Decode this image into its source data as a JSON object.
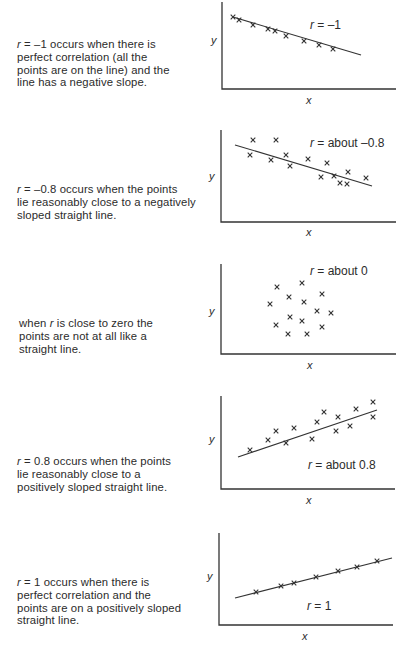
{
  "figure": {
    "panels": [
      {
        "id": "r-minus-1",
        "description_lines": [
          "r = –1 occurs when there is",
          "perfect correlation (all the",
          "points are on the line) and the",
          "line has a negative slope."
        ],
        "label_prefix": "r",
        "label_value": " = –1",
        "x_axis_label": "x",
        "y_axis_label": "y"
      },
      {
        "id": "r-minus-0.8",
        "description_lines": [
          "r = –0.8 occurs when the points",
          "lie reasonably close to a negatively",
          "sloped straight line."
        ],
        "label_prefix": "r",
        "label_value": " = about –0.8",
        "x_axis_label": "x",
        "y_axis_label": "y"
      },
      {
        "id": "r-about-0",
        "description_lines": [
          "when r is close to zero the",
          "points are not at all like a",
          "straight line."
        ],
        "label_prefix": "r",
        "label_value": " = about 0",
        "x_axis_label": "x",
        "y_axis_label": "y"
      },
      {
        "id": "r-0.8",
        "description_lines": [
          "r = 0.8 occurs when the points",
          "lie reasonably close to a",
          "positively sloped straight line."
        ],
        "label_prefix": "r",
        "label_value": " = about 0.8",
        "x_axis_label": "x",
        "y_axis_label": "y"
      },
      {
        "id": "r-1",
        "description_lines": [
          "r = 1 occurs when there is",
          "perfect correlation and the",
          "points are on a positively sloped",
          "straight line."
        ],
        "label_prefix": "r",
        "label_value": " = 1",
        "x_axis_label": "x",
        "y_axis_label": "y"
      }
    ]
  },
  "chart_data": [
    {
      "type": "scatter",
      "title": "r = –1",
      "xlabel": "x",
      "ylabel": "y",
      "grid": false,
      "trend_line": true,
      "correlation": -1,
      "points": [
        [
          233,
          17
        ],
        [
          239,
          20
        ],
        [
          253,
          25
        ],
        [
          268,
          29
        ],
        [
          275,
          31
        ],
        [
          286,
          36
        ],
        [
          304,
          41
        ],
        [
          319,
          45
        ],
        [
          333,
          49
        ]
      ],
      "pixel_points_note_excluded": true
    },
    {
      "type": "scatter",
      "title": "r = about –0.8",
      "xlabel": "x",
      "ylabel": "y",
      "grid": false,
      "trend_line": true,
      "correlation": -0.8,
      "points": [
        [
          253,
          140
        ],
        [
          276,
          140
        ],
        [
          250,
          155
        ],
        [
          271,
          160
        ],
        [
          286,
          155
        ],
        [
          290,
          166
        ],
        [
          308,
          159
        ],
        [
          327,
          163
        ],
        [
          321,
          177
        ],
        [
          340,
          183
        ],
        [
          348,
          172
        ],
        [
          334,
          176
        ],
        [
          347,
          184
        ],
        [
          366,
          178
        ]
      ]
    },
    {
      "type": "scatter",
      "title": "r = about 0",
      "xlabel": "x",
      "ylabel": "y",
      "grid": false,
      "trend_line": false,
      "correlation": 0,
      "points": [
        [
          277,
          287
        ],
        [
          302,
          283
        ],
        [
          289,
          297
        ],
        [
          304,
          302
        ],
        [
          322,
          294
        ],
        [
          270,
          304
        ],
        [
          290,
          317
        ],
        [
          317,
          311
        ],
        [
          331,
          313
        ],
        [
          302,
          321
        ],
        [
          276,
          325
        ],
        [
          322,
          327
        ],
        [
          288,
          334
        ],
        [
          307,
          334
        ]
      ]
    },
    {
      "type": "scatter",
      "title": "r = about 0.8",
      "xlabel": "x",
      "ylabel": "y",
      "grid": false,
      "trend_line": true,
      "correlation": 0.8,
      "points": [
        [
          250,
          450
        ],
        [
          268,
          440
        ],
        [
          276,
          431
        ],
        [
          294,
          428
        ],
        [
          286,
          443
        ],
        [
          312,
          439
        ],
        [
          317,
          422
        ],
        [
          324,
          412
        ],
        [
          336,
          431
        ],
        [
          338,
          417
        ],
        [
          350,
          426
        ],
        [
          356,
          409
        ],
        [
          373,
          402
        ],
        [
          373,
          417
        ]
      ]
    },
    {
      "type": "scatter",
      "title": "r = 1",
      "xlabel": "x",
      "ylabel": "y",
      "grid": false,
      "trend_line": true,
      "correlation": 1,
      "points": [
        [
          256,
          592
        ],
        [
          281,
          586
        ],
        [
          294,
          583
        ],
        [
          316,
          577
        ],
        [
          338,
          571
        ],
        [
          357,
          567
        ],
        [
          377,
          561
        ]
      ]
    }
  ]
}
